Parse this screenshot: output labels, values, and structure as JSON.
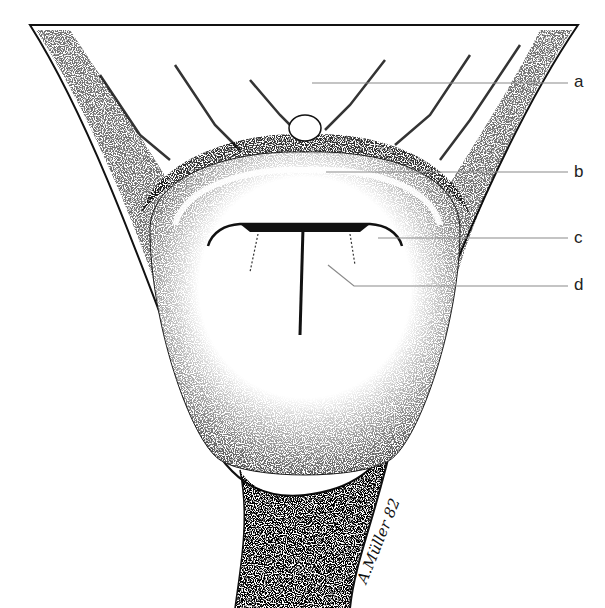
{
  "figure": {
    "labels": [
      {
        "id": "a",
        "text": "a",
        "x": 576,
        "y": 73
      },
      {
        "id": "b",
        "text": "b",
        "x": 576,
        "y": 164
      },
      {
        "id": "c",
        "text": "c",
        "x": 576,
        "y": 229
      },
      {
        "id": "d",
        "text": "d",
        "x": 576,
        "y": 276
      }
    ],
    "leaders": [
      {
        "id": "a",
        "x1": 312,
        "y1": 83,
        "x2": 568,
        "y2": 83
      },
      {
        "id": "b",
        "x1": 326,
        "y1": 172,
        "x2": 568,
        "y2": 172
      },
      {
        "id": "c",
        "x1": 378,
        "y1": 238,
        "x2": 568,
        "y2": 238
      },
      {
        "id": "d",
        "x1": 328,
        "y1": 265,
        "x2": 354,
        "y2": 286,
        "x3": 568,
        "y3": 286
      }
    ],
    "signature": "A.Müller 82",
    "colors": {
      "ink": "#111111",
      "leader": "#8a8a8a",
      "paper": "#ffffff"
    }
  }
}
